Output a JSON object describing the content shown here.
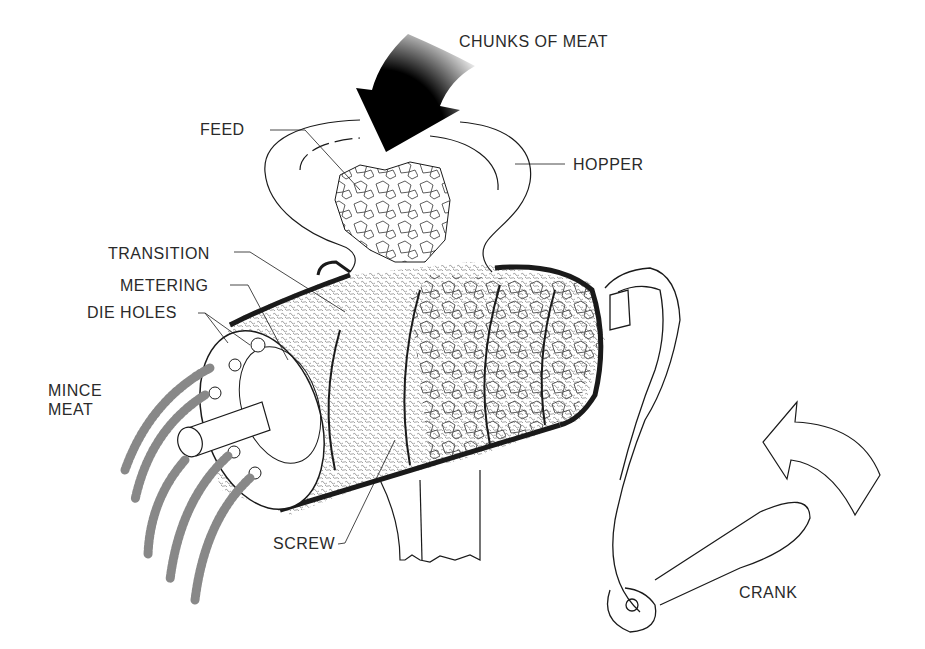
{
  "diagram": {
    "labels": {
      "chunks_of_meat": "CHUNKS OF MEAT",
      "feed": "FEED",
      "hopper": "HOPPER",
      "transition": "TRANSITION",
      "metering": "METERING",
      "die_holes": "DIE HOLES",
      "mince_meat": "MINCE\nMEAT",
      "screw": "SCREW",
      "crank": "CRANK"
    },
    "colors": {
      "ink": "#1a1a1a",
      "background": "#ffffff",
      "label_text": "#2a2a2a"
    }
  }
}
